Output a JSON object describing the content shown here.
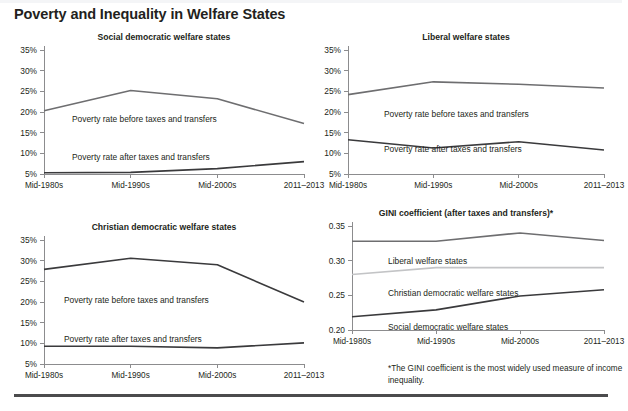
{
  "header": {
    "title": "Poverty and Inequality in Welfare States"
  },
  "axis": {
    "x_categories": [
      "Mid-1980s",
      "Mid-1990s",
      "Mid-2000s",
      "2011–2013"
    ],
    "pct_ticks": [
      "5%",
      "10%",
      "15%",
      "20%",
      "25%",
      "30%",
      "35%"
    ],
    "gini_ticks": [
      "0.20",
      "0.25",
      "0.30",
      "0.35"
    ]
  },
  "series_labels": {
    "before": "Poverty rate before taxes and transfers",
    "after": "Poverty rate after taxes and transfers",
    "liberal": "Liberal welfare states",
    "christian": "Christian democratic welfare states",
    "social": "Social democratic welfare states"
  },
  "colors": {
    "dark_line": "#3a3a3c",
    "mid_line": "#6e6e70",
    "light_line": "#c3c4c6",
    "axis": "#8c8c8e",
    "text": "#231f20",
    "rule": "#4b4b4d"
  },
  "footnote": {
    "text": "*The GINI coefficient is the most widely used measure of income inequality."
  },
  "chart_data": [
    {
      "type": "line",
      "title": "Social democratic welfare states",
      "xlabel": "",
      "ylabel": "",
      "categories": [
        "Mid-1980s",
        "Mid-1990s",
        "Mid-2000s",
        "2011–2013"
      ],
      "ylim": [
        5,
        35
      ],
      "ytick_values": [
        5,
        10,
        15,
        20,
        25,
        30,
        35
      ],
      "ytick_labels": [
        "5%",
        "10%",
        "15%",
        "20%",
        "25%",
        "30%",
        "35%"
      ],
      "grid": false,
      "legend": "inline-annotations",
      "series": [
        {
          "name": "Poverty rate before taxes and transfers",
          "values": [
            20.3,
            25.2,
            23.2,
            17.2
          ],
          "color": "#6e6e70"
        },
        {
          "name": "Poverty rate after taxes and transfers",
          "values": [
            5.3,
            5.4,
            6.3,
            8.0
          ],
          "color": "#3a3a3c"
        }
      ]
    },
    {
      "type": "line",
      "title": "Liberal welfare states",
      "xlabel": "",
      "ylabel": "",
      "categories": [
        "Mid-1980s",
        "Mid-1990s",
        "Mid-2000s",
        "2011–2013"
      ],
      "ylim": [
        5,
        35
      ],
      "ytick_values": [
        5,
        10,
        15,
        20,
        25,
        30,
        35
      ],
      "ytick_labels": [
        "5%",
        "10%",
        "15%",
        "20%",
        "25%",
        "30%",
        "35%"
      ],
      "grid": false,
      "legend": "inline-annotations",
      "series": [
        {
          "name": "Poverty rate before taxes and transfers",
          "values": [
            24.2,
            27.3,
            26.7,
            25.8
          ],
          "color": "#6e6e70"
        },
        {
          "name": "Poverty rate after taxes and transfers",
          "values": [
            13.3,
            11.3,
            12.8,
            10.8
          ],
          "color": "#3a3a3c"
        }
      ]
    },
    {
      "type": "line",
      "title": "Christian democratic welfare states",
      "xlabel": "",
      "ylabel": "",
      "categories": [
        "Mid-1980s",
        "Mid-1990s",
        "Mid-2000s",
        "2011–2013"
      ],
      "ylim": [
        5,
        35
      ],
      "ytick_values": [
        5,
        10,
        15,
        20,
        25,
        30,
        35
      ],
      "ytick_labels": [
        "5%",
        "10%",
        "15%",
        "20%",
        "25%",
        "30%",
        "35%"
      ],
      "grid": false,
      "legend": "inline-annotations",
      "series": [
        {
          "name": "Poverty rate before taxes and transfers",
          "values": [
            27.9,
            30.6,
            29.0,
            20.0
          ],
          "color": "#3a3a3c"
        },
        {
          "name": "Poverty rate after taxes and transfers",
          "values": [
            9.3,
            9.3,
            8.9,
            10.1
          ],
          "color": "#3a3a3c"
        }
      ]
    },
    {
      "type": "line",
      "title": "GINI coefficient (after taxes and transfers)*",
      "xlabel": "",
      "ylabel": "",
      "categories": [
        "Mid-1980s",
        "Mid-1990s",
        "Mid-2000s",
        "2011–2013"
      ],
      "ylim": [
        0.2,
        0.35
      ],
      "ytick_values": [
        0.2,
        0.25,
        0.3,
        0.35
      ],
      "ytick_labels": [
        "0.20",
        "0.25",
        "0.30",
        "0.35"
      ],
      "grid": false,
      "legend": "inline-annotations",
      "series": [
        {
          "name": "Liberal welfare states",
          "values": [
            0.328,
            0.328,
            0.34,
            0.329
          ],
          "color": "#6e6e70"
        },
        {
          "name": "Christian democratic welfare states",
          "values": [
            0.28,
            0.29,
            0.29,
            0.29
          ],
          "color": "#c3c4c6"
        },
        {
          "name": "Social democratic welfare states",
          "values": [
            0.219,
            0.229,
            0.249,
            0.258
          ],
          "color": "#3a3a3c"
        }
      ]
    }
  ]
}
